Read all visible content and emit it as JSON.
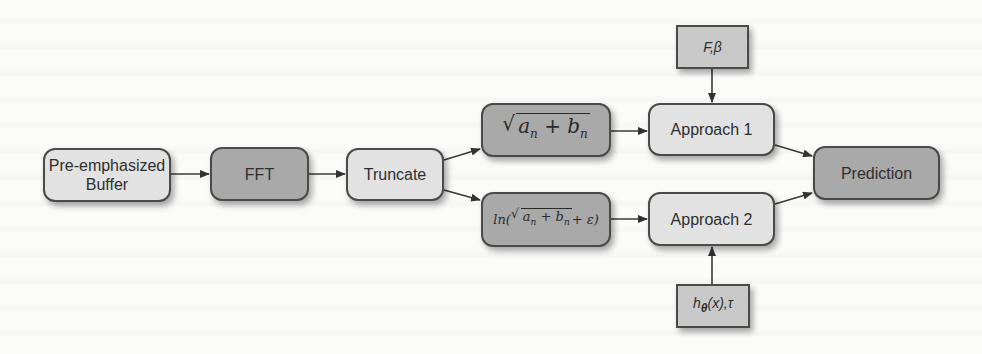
{
  "diagram": {
    "type": "flowchart",
    "nodes": {
      "buffer": {
        "line1": "Pre-emphasized",
        "line2": "Buffer"
      },
      "fft": {
        "label": "FFT"
      },
      "truncate": {
        "label": "Truncate"
      },
      "magnitude": {
        "label": "√(a_n + b_n)",
        "radicand": "a",
        "sub_a": "n",
        "plus": " + ",
        "b": "b",
        "sub_b": "n"
      },
      "log_magnitude": {
        "label": "ln(√(a_n + b_n) + ε)",
        "prefix": "ln(",
        "a": "a",
        "sub_a": "n",
        "plus": " + ",
        "b": "b",
        "sub_b": "n",
        "suffix": " + ε)"
      },
      "approach1": {
        "label": "Approach 1"
      },
      "approach2": {
        "label": "Approach 2"
      },
      "params1": {
        "label": "F,β"
      },
      "params2": {
        "h": "h",
        "sub": "θ",
        "rest": "(x),τ",
        "label": "hθ(x),τ"
      },
      "prediction": {
        "label": "Prediction"
      }
    },
    "edges": [
      {
        "from": "buffer",
        "to": "fft"
      },
      {
        "from": "fft",
        "to": "truncate"
      },
      {
        "from": "truncate",
        "to": "magnitude"
      },
      {
        "from": "truncate",
        "to": "log_magnitude"
      },
      {
        "from": "magnitude",
        "to": "approach1"
      },
      {
        "from": "log_magnitude",
        "to": "approach2"
      },
      {
        "from": "params1",
        "to": "approach1"
      },
      {
        "from": "params2",
        "to": "approach2"
      },
      {
        "from": "approach1",
        "to": "prediction"
      },
      {
        "from": "approach2",
        "to": "prediction"
      }
    ],
    "colors": {
      "light_fill": "#e2e2e2",
      "dark_fill": "#a9a9a9",
      "param_fill": "#c9c9c9",
      "stroke": "#4a4a4a"
    }
  }
}
